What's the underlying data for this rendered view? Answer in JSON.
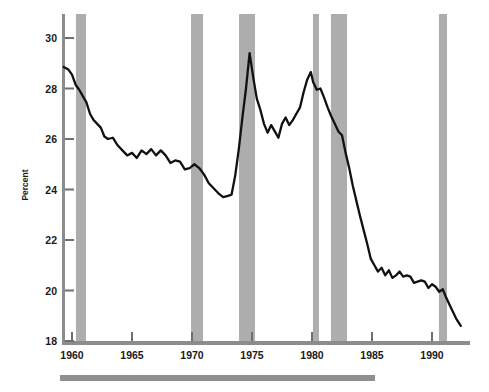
{
  "figure": {
    "background_color": "#ffffff",
    "axis_color": "#8c8c8c",
    "line_color": "#111111",
    "band_color": "#adadad",
    "footer_bar_color": "#8f8f8f"
  },
  "chart_data": {
    "type": "line",
    "title": "",
    "subtitle": "",
    "xlabel": "",
    "ylabel": "Percent",
    "xlim": [
      1959.25,
      1992.6
    ],
    "ylim": [
      18,
      30.5
    ],
    "ytick_values": [
      18,
      20,
      22,
      24,
      26,
      28,
      30
    ],
    "ytick_labels": [
      "18",
      "20",
      "22",
      "24",
      "26",
      "28",
      "30"
    ],
    "xtick_values": [
      1960,
      1965,
      1970,
      1975,
      1980,
      1985,
      1990
    ],
    "xtick_labels": [
      "1960",
      "1965",
      "1970",
      "1975",
      "1980",
      "1985",
      "1990"
    ],
    "grid": false,
    "legend": null,
    "legend_position": "none",
    "series": [
      {
        "name": "Percent",
        "x": [
          1959.3,
          1959.7,
          1960.0,
          1960.3,
          1960.6,
          1960.9,
          1961.2,
          1961.5,
          1961.8,
          1962.1,
          1962.4,
          1962.7,
          1963.0,
          1963.4,
          1963.8,
          1964.2,
          1964.6,
          1965.0,
          1965.4,
          1965.8,
          1966.2,
          1966.6,
          1967.0,
          1967.4,
          1967.8,
          1968.2,
          1968.6,
          1969.0,
          1969.4,
          1969.8,
          1970.2,
          1970.6,
          1971.0,
          1971.4,
          1971.8,
          1972.2,
          1972.6,
          1973.0,
          1973.3,
          1973.6,
          1973.9,
          1974.2,
          1974.5,
          1974.8,
          1975.1,
          1975.4,
          1975.7,
          1976.0,
          1976.3,
          1976.6,
          1976.9,
          1977.2,
          1977.5,
          1977.8,
          1978.1,
          1978.4,
          1978.7,
          1979.0,
          1979.3,
          1979.6,
          1979.9,
          1980.1,
          1980.4,
          1980.7,
          1981.0,
          1981.3,
          1981.6,
          1981.9,
          1982.2,
          1982.5,
          1982.8,
          1983.1,
          1983.4,
          1983.7,
          1984.0,
          1984.3,
          1984.6,
          1984.9,
          1985.2,
          1985.5,
          1985.8,
          1986.1,
          1986.4,
          1986.7,
          1987.0,
          1987.3,
          1987.6,
          1987.9,
          1988.2,
          1988.5,
          1988.8,
          1989.1,
          1989.4,
          1989.7,
          1990.0,
          1990.3,
          1990.6,
          1990.9,
          1991.2,
          1991.6,
          1992.0,
          1992.4
        ],
        "y": [
          28.85,
          28.75,
          28.55,
          28.15,
          27.95,
          27.7,
          27.45,
          27.0,
          26.75,
          26.6,
          26.45,
          26.1,
          26.0,
          26.05,
          25.75,
          25.55,
          25.35,
          25.45,
          25.25,
          25.55,
          25.4,
          25.6,
          25.35,
          25.55,
          25.35,
          25.05,
          25.15,
          25.1,
          24.8,
          24.85,
          25.0,
          24.85,
          24.6,
          24.25,
          24.05,
          23.85,
          23.7,
          23.75,
          23.8,
          24.55,
          25.6,
          26.85,
          28.0,
          29.4,
          28.45,
          27.6,
          27.15,
          26.6,
          26.25,
          26.55,
          26.3,
          26.05,
          26.6,
          26.85,
          26.55,
          26.75,
          27.0,
          27.25,
          27.85,
          28.35,
          28.65,
          28.25,
          27.95,
          28.0,
          27.65,
          27.25,
          26.9,
          26.6,
          26.3,
          26.15,
          25.45,
          24.85,
          24.15,
          23.55,
          22.95,
          22.4,
          21.85,
          21.25,
          21.0,
          20.75,
          20.9,
          20.6,
          20.8,
          20.5,
          20.6,
          20.75,
          20.55,
          20.6,
          20.55,
          20.3,
          20.35,
          20.4,
          20.35,
          20.1,
          20.25,
          20.15,
          19.95,
          20.05,
          19.7,
          19.3,
          18.9,
          18.6
        ]
      }
    ],
    "shaded_bands": [
      {
        "label": "recession",
        "start": 1960.33,
        "end": 1961.17
      },
      {
        "label": "recession",
        "start": 1969.92,
        "end": 1970.92
      },
      {
        "label": "recession",
        "start": 1973.92,
        "end": 1975.25
      },
      {
        "label": "recession",
        "start": 1980.08,
        "end": 1980.58
      },
      {
        "label": "recession",
        "start": 1981.58,
        "end": 1982.92
      },
      {
        "label": "recession",
        "start": 1990.58,
        "end": 1991.25
      }
    ],
    "annotations": []
  },
  "accessibility": {
    "y_axis_title": "Percent",
    "footer_bar": ""
  }
}
